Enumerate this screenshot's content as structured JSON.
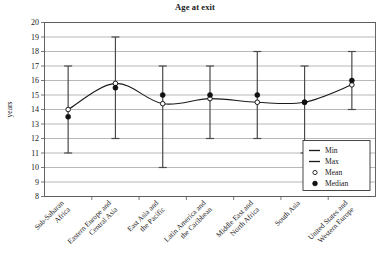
{
  "chart_data": {
    "type": "line",
    "title": "Age at exit",
    "xlabel": "",
    "ylabel": "years",
    "ylim": [
      8,
      20
    ],
    "ytick_step": 1,
    "yticks": [
      8,
      9,
      10,
      11,
      12,
      13,
      14,
      15,
      16,
      17,
      18,
      19,
      20
    ],
    "grid": true,
    "legend_position": "bottom-right",
    "categories": [
      "Sub-Saharan Africa",
      "Eastern Europe and Central Asia",
      "East Asia and the Pacific",
      "Latin America and the Caribbean",
      "Middle East and North Africa",
      "South Asia",
      "United States and Western Europe"
    ],
    "category_lines": [
      [
        "Sub-Saharan",
        "Africa"
      ],
      [
        "Eastern Europe and",
        "Central Asia"
      ],
      [
        "East Asia and",
        "the Pacific"
      ],
      [
        "Latin America and",
        "the Caribbean"
      ],
      [
        "Middle East and",
        "North Africa"
      ],
      [
        "South Asia",
        ""
      ],
      [
        "United States and",
        "Western Europe"
      ]
    ],
    "series": [
      {
        "name": "Min",
        "values": [
          11,
          12,
          10,
          12,
          12,
          11,
          14
        ]
      },
      {
        "name": "Max",
        "values": [
          17,
          19,
          17,
          17,
          18,
          17,
          18
        ]
      },
      {
        "name": "Mean",
        "values": [
          14.0,
          15.8,
          14.4,
          14.75,
          14.5,
          14.5,
          15.7
        ]
      },
      {
        "name": "Median",
        "values": [
          13.5,
          15.5,
          15.0,
          15.0,
          15.0,
          14.5,
          16.0
        ]
      }
    ]
  },
  "legend": {
    "items": [
      {
        "label": "Min",
        "marker": "dash-icon"
      },
      {
        "label": "Max",
        "marker": "dash-icon"
      },
      {
        "label": "Mean",
        "marker": "open-circle-icon"
      },
      {
        "label": "Median",
        "marker": "filled-circle-icon"
      }
    ]
  },
  "colors": {
    "line": "#1a1a1a",
    "grid": "#9a9a9a",
    "axis": "#555555",
    "whisker": "#4a4a4a",
    "marker_fill": "#111111",
    "background": "#ffffff"
  }
}
